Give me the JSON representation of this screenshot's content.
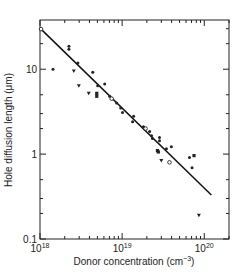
{
  "chart_data": {
    "type": "scatter",
    "title": "",
    "xlabel": "Donor concentration (cm",
    "xlabel_sup": "−3",
    "xlabel_close": ")",
    "ylabel": "Hole diffusion length (μm)",
    "x_scale": "log",
    "y_scale": "log",
    "xlim": [
      1e+18,
      2e+20
    ],
    "ylim": [
      0.1,
      38
    ],
    "grid": false,
    "legend": "none",
    "x_ticks": [
      {
        "value": 1e+18,
        "base": "10",
        "exp": "18"
      },
      {
        "value": 1e+19,
        "base": "10",
        "exp": "19"
      },
      {
        "value": 1e+20,
        "base": "10",
        "exp": "20"
      }
    ],
    "y_ticks": [
      {
        "value": 0.1,
        "label": "0.1"
      },
      {
        "value": 1,
        "label": "1"
      },
      {
        "value": 10,
        "label": "10"
      }
    ],
    "fit_line": {
      "x": [
        1e+18,
        1.22e+20
      ],
      "y": [
        30.5,
        0.33
      ]
    },
    "series": [
      {
        "name": "data",
        "points": [
          {
            "x": 1.03e+18,
            "y": 29.7,
            "marker": "circle"
          },
          {
            "x": 2.25e+18,
            "y": 18.7,
            "marker": "dot"
          },
          {
            "x": 2.25e+18,
            "y": 17.2,
            "marker": "dot"
          },
          {
            "x": 1.44e+18,
            "y": 10.0,
            "marker": "dot"
          },
          {
            "x": 2.89e+18,
            "y": 11.8,
            "marker": "dot"
          },
          {
            "x": 2.58e+18,
            "y": 9.5,
            "marker": "triangle"
          },
          {
            "x": 4.39e+18,
            "y": 9.2,
            "marker": "dot"
          },
          {
            "x": 2.97e+18,
            "y": 6.4,
            "marker": "triangle"
          },
          {
            "x": 3.92e+18,
            "y": 5.2,
            "marker": "triangle"
          },
          {
            "x": 4.91e+18,
            "y": 5.2,
            "marker": "square"
          },
          {
            "x": 4.91e+18,
            "y": 4.8,
            "marker": "square"
          },
          {
            "x": 6.13e+18,
            "y": 6.7,
            "marker": "dot"
          },
          {
            "x": 5.04e+18,
            "y": 6.4,
            "marker": "dot"
          },
          {
            "x": 7.06e+18,
            "y": 4.8,
            "marker": "dot"
          },
          {
            "x": 7.46e+18,
            "y": 4.5,
            "marker": "circle"
          },
          {
            "x": 8.57e+18,
            "y": 4.0,
            "marker": "dot"
          },
          {
            "x": 9.6e+18,
            "y": 3.5,
            "marker": "dot"
          },
          {
            "x": 1.01e+19,
            "y": 3.1,
            "marker": "dot"
          },
          {
            "x": 1.38e+19,
            "y": 2.8,
            "marker": "dot"
          },
          {
            "x": 1.34e+19,
            "y": 2.4,
            "marker": "dot"
          },
          {
            "x": 1.82e+19,
            "y": 2.1,
            "marker": "dot"
          },
          {
            "x": 1.93e+19,
            "y": 2.0,
            "marker": "circle"
          },
          {
            "x": 2.16e+19,
            "y": 1.85,
            "marker": "dot"
          },
          {
            "x": 2.28e+19,
            "y": 1.65,
            "marker": "dot"
          },
          {
            "x": 2.34e+19,
            "y": 1.53,
            "marker": "dot"
          },
          {
            "x": 2.85e+19,
            "y": 1.57,
            "marker": "dot"
          },
          {
            "x": 2.85e+19,
            "y": 1.44,
            "marker": "dot"
          },
          {
            "x": 2.69e+19,
            "y": 1.1,
            "marker": "square"
          },
          {
            "x": 2.76e+19,
            "y": 1.06,
            "marker": "square"
          },
          {
            "x": 3.46e+19,
            "y": 1.16,
            "marker": "dot"
          },
          {
            "x": 3.97e+19,
            "y": 1.22,
            "marker": "dot"
          },
          {
            "x": 3e+19,
            "y": 0.84,
            "marker": "triangle"
          },
          {
            "x": 3.77e+19,
            "y": 0.8,
            "marker": "circle"
          },
          {
            "x": 6.6e+19,
            "y": 0.91,
            "marker": "dot"
          },
          {
            "x": 7.5e+19,
            "y": 0.96,
            "marker": "square"
          },
          {
            "x": 7.1e+19,
            "y": 0.69,
            "marker": "dot"
          },
          {
            "x": 8.6e+19,
            "y": 0.19,
            "marker": "triangle"
          }
        ]
      }
    ]
  }
}
